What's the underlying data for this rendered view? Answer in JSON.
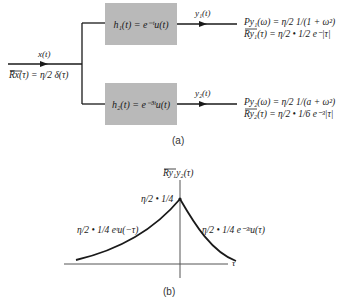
{
  "diagram_a": {
    "input": {
      "signal_label": "x(t)",
      "autocorr": "R̅x(τ) = η/2 δ(τ)"
    },
    "filters": [
      {
        "id": "h1",
        "label": "h₁(t) = e⁻ᵗu(t)",
        "output_label": "y₁(t)",
        "psd": "Py₁(ω) = η/2 1/(1 + ω²)",
        "autocorr": "Ry₁(τ) = η/2 • 1/2 e⁻|τ|"
      },
      {
        "id": "h2",
        "label": "h₂(t) = e⁻³ᵗu(t)",
        "output_label": "y₂(t)",
        "psd": "Py₂(ω) = η/2 1/(a + ω²)",
        "autocorr": "Ry₂(τ) = η/2 • 1/6 e⁻³|τ|"
      }
    ],
    "caption": "(a)"
  },
  "diagram_b": {
    "y_axis_label": "Ry₁y₂(τ)",
    "x_axis_label": "τ",
    "peak_label": "η/2 • 1/4",
    "left_curve_label": "η/2 • 1/4 eᵗu(−τ)",
    "right_curve_label": "η/2 • 1/4 e⁻³ᵗu(τ)",
    "caption": "(b)"
  },
  "colors": {
    "box_fill": "#b9b9b9",
    "line": "#1a1a1a",
    "axis": "#555555"
  }
}
